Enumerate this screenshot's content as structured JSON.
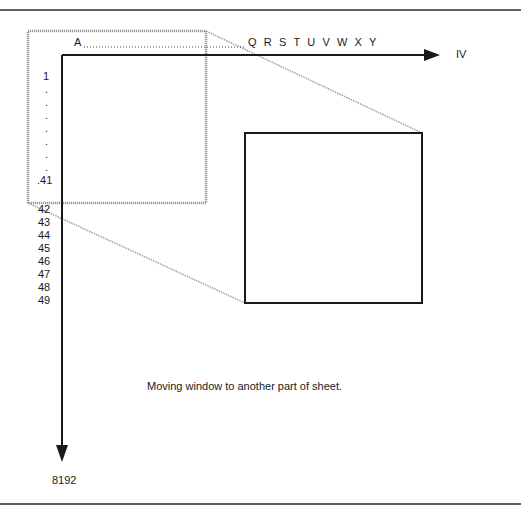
{
  "diagram": {
    "type": "spreadsheet-window-illustration",
    "columns": {
      "start_label": "A",
      "leader": "..............................................",
      "visible_letters": "Q R S T U V W X Y",
      "end_label": "IV"
    },
    "rows": {
      "top_labels": [
        "1",
        ".",
        ".",
        ".",
        ".",
        ".",
        ".",
        ".",
        ".41"
      ],
      "bottom_labels": [
        "42",
        "43",
        "44",
        "45",
        "46",
        "47",
        "48",
        "49"
      ],
      "end_label": "8192"
    },
    "caption": "Moving window to another part of sheet.",
    "colors": {
      "line": "#1a1a1a",
      "dotted_window": "#9a9a9a",
      "background": "#ffffff"
    }
  }
}
